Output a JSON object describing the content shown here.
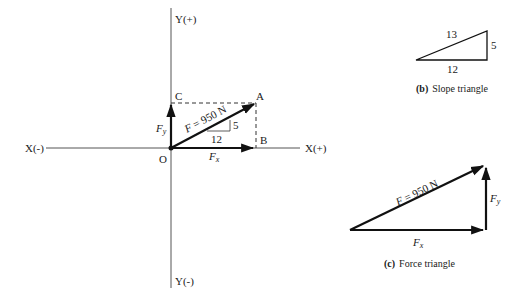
{
  "figure_a": {
    "axes": {
      "x_neg_label": "X(-)",
      "x_pos_label": "X(+)",
      "y_pos_label": "Y(+)",
      "y_neg_label": "Y(-)"
    },
    "points": {
      "origin": "O",
      "a": "A",
      "b": "B",
      "c": "C"
    },
    "force_label": "F = 950 N",
    "fx_label": "Fx",
    "fy_label": "Fy",
    "slope_rise": "5",
    "slope_run": "12"
  },
  "figure_b": {
    "hypotenuse": "13",
    "rise": "5",
    "run": "12",
    "caption_letter": "(b)",
    "caption_text": "Slope triangle"
  },
  "figure_c": {
    "force_label": "F = 950 N",
    "fx_label": "Fx",
    "fy_label": "Fy",
    "caption_letter": "(c)",
    "caption_text": "Force triangle"
  }
}
